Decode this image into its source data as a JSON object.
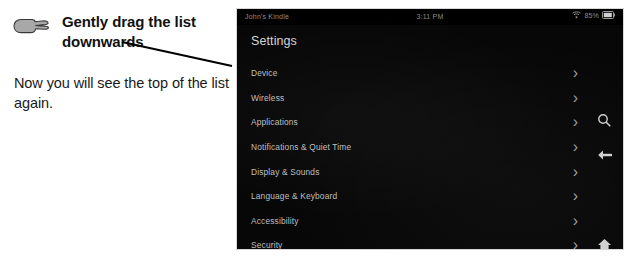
{
  "annotation": {
    "hand_icon": "pointing-hand-icon",
    "headline": "Gently drag the list downwards",
    "subtext": "Now you will see the top of the list again."
  },
  "device": {
    "status_bar": {
      "device_name": "John's Kindle",
      "clock": "3:11 PM",
      "wifi_icon": "wifi-icon",
      "battery_percent": "85%",
      "battery_icon": "battery-icon"
    },
    "header_title": "Settings",
    "list": {
      "chevron_glyph": "›",
      "items": [
        {
          "label": "Device"
        },
        {
          "label": "Wireless"
        },
        {
          "label": "Applications"
        },
        {
          "label": "Notifications & Quiet Time"
        },
        {
          "label": "Display & Sounds"
        },
        {
          "label": "Language & Keyboard"
        },
        {
          "label": "Accessibility"
        },
        {
          "label": "Security"
        }
      ]
    },
    "toolbar": {
      "search_icon": "search-icon",
      "back_icon": "back-arrow-icon",
      "home_icon": "home-icon"
    }
  },
  "colors": {
    "page_background": "#ffffff",
    "device_background": "#070707",
    "list_text": "#bfbfbf",
    "header_text": "#d5d5d5",
    "status_text": "#8e8e8e",
    "annotation_text": "#111111",
    "leader_line": "#000000",
    "drag_line": "#ffffff"
  }
}
